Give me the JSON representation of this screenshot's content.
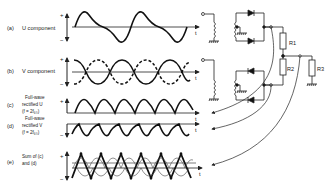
{
  "diagram": {
    "traces": [
      {
        "id": "a",
        "prefix": "(a)",
        "label": "U component"
      },
      {
        "id": "b",
        "prefix": "(b)",
        "label": "V component"
      },
      {
        "id": "c",
        "prefix": "(c)",
        "line1": "Full-wave",
        "line2": "rectified U",
        "line3": "(f = 2f₆₀)"
      },
      {
        "id": "d",
        "prefix": "(d)",
        "line1": "Full-wave",
        "line2": "rectified V",
        "line3": "(f = 2f₆₀)"
      },
      {
        "id": "e",
        "prefix": "(e)",
        "line1": "Sum of (c)",
        "line2": "and (d)"
      }
    ],
    "axis": {
      "plus": "+",
      "minus": "−",
      "time": "t"
    },
    "resistors": {
      "r1": "R1",
      "r2": "R2",
      "r3": "R3"
    }
  }
}
